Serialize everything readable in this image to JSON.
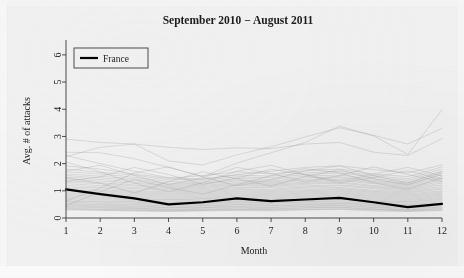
{
  "figure": {
    "title": "September 2010 − August 2011",
    "background_color": "#ededed",
    "panel_color": "#f1f1f1"
  },
  "legend": {
    "entries": [
      {
        "label": "France",
        "color": "#000000",
        "linewidth": 2.2
      }
    ]
  },
  "chart_data": {
    "type": "line",
    "title": "September 2010 − August 2011",
    "xlabel": "Month",
    "ylabel": "Avg. # of attacks",
    "xlim": [
      1,
      12
    ],
    "ylim": [
      0,
      6.4
    ],
    "xticks": [
      1,
      2,
      3,
      4,
      5,
      6,
      7,
      8,
      9,
      10,
      11,
      12
    ],
    "xticklabels": [
      "1",
      "2",
      "3",
      "4",
      "5",
      "6",
      "7",
      "8",
      "9",
      "10",
      "11",
      "12"
    ],
    "yticks": [
      0,
      1,
      2,
      3,
      4,
      5,
      6
    ],
    "yticklabels": [
      "0",
      "1",
      "2",
      "3",
      "4",
      "5",
      "6"
    ],
    "grid": false,
    "legend_position": "upper left",
    "x": [
      1,
      2,
      3,
      4,
      5,
      6,
      7,
      8,
      9,
      10,
      11,
      12
    ],
    "highlight_color": "#000000",
    "background_series_color": "#9a9a9a",
    "series": [
      {
        "name": "France",
        "highlight": true,
        "values": [
          1.05,
          0.88,
          0.72,
          0.5,
          0.58,
          0.72,
          0.62,
          0.68,
          0.74,
          0.58,
          0.4,
          0.52
        ]
      },
      {
        "name": "country-01",
        "highlight": false,
        "values": [
          2.9,
          2.78,
          2.72,
          2.6,
          2.52,
          2.58,
          2.55,
          2.72,
          2.78,
          2.42,
          2.3,
          2.92
        ]
      },
      {
        "name": "country-02",
        "highlight": false,
        "values": [
          2.26,
          2.6,
          2.72,
          2.1,
          1.95,
          2.32,
          2.62,
          2.98,
          3.32,
          3.04,
          2.72,
          3.3
        ]
      },
      {
        "name": "country-03",
        "highlight": false,
        "values": [
          2.42,
          2.4,
          2.18,
          1.86,
          1.52,
          2.02,
          2.4,
          2.78,
          3.38,
          3.02,
          2.34,
          3.98
        ]
      },
      {
        "name": "country-04",
        "highlight": false,
        "values": [
          2.3,
          2.0,
          1.72,
          1.48,
          1.42,
          1.6,
          1.72,
          1.86,
          1.92,
          1.78,
          1.66,
          1.95
        ]
      },
      {
        "name": "country-05",
        "highlight": false,
        "values": [
          1.92,
          1.8,
          1.62,
          1.46,
          1.56,
          1.7,
          1.62,
          1.74,
          1.8,
          1.62,
          1.52,
          1.88
        ]
      },
      {
        "name": "country-06",
        "highlight": false,
        "values": [
          1.8,
          1.68,
          1.58,
          1.4,
          1.44,
          1.58,
          1.54,
          1.66,
          1.72,
          1.56,
          1.44,
          1.8
        ]
      },
      {
        "name": "country-07",
        "highlight": false,
        "values": [
          1.7,
          1.62,
          1.5,
          1.34,
          1.38,
          1.52,
          1.48,
          1.6,
          1.66,
          1.5,
          1.38,
          1.72
        ]
      },
      {
        "name": "country-08",
        "highlight": false,
        "values": [
          1.62,
          1.54,
          1.44,
          1.28,
          1.32,
          1.46,
          1.42,
          1.54,
          1.58,
          1.44,
          1.32,
          1.66
        ]
      },
      {
        "name": "country-09",
        "highlight": false,
        "values": [
          1.56,
          1.48,
          1.38,
          1.24,
          1.28,
          1.4,
          1.36,
          1.48,
          1.52,
          1.38,
          1.28,
          1.58
        ]
      },
      {
        "name": "country-10",
        "highlight": false,
        "values": [
          1.5,
          1.42,
          1.32,
          1.2,
          1.24,
          1.36,
          1.32,
          1.42,
          1.48,
          1.34,
          1.24,
          1.52
        ]
      },
      {
        "name": "country-11",
        "highlight": false,
        "values": [
          1.44,
          1.36,
          1.28,
          1.16,
          1.2,
          1.3,
          1.28,
          1.38,
          1.42,
          1.3,
          1.2,
          1.46
        ]
      },
      {
        "name": "country-12",
        "highlight": false,
        "values": [
          1.38,
          1.3,
          1.22,
          1.12,
          1.16,
          1.26,
          1.24,
          1.32,
          1.38,
          1.26,
          1.16,
          1.4
        ]
      },
      {
        "name": "country-13",
        "highlight": false,
        "values": [
          1.32,
          1.26,
          1.18,
          1.08,
          1.12,
          1.22,
          1.2,
          1.28,
          1.32,
          1.2,
          1.12,
          1.34
        ]
      },
      {
        "name": "country-14",
        "highlight": false,
        "values": [
          1.26,
          1.2,
          1.12,
          1.04,
          1.08,
          1.18,
          1.16,
          1.24,
          1.28,
          1.16,
          1.08,
          1.28
        ]
      },
      {
        "name": "country-15",
        "highlight": false,
        "values": [
          1.2,
          1.14,
          1.08,
          1.0,
          1.04,
          1.12,
          1.12,
          1.18,
          1.22,
          1.12,
          1.04,
          1.22
        ]
      },
      {
        "name": "country-16",
        "highlight": false,
        "values": [
          1.14,
          1.1,
          1.02,
          0.96,
          1.0,
          1.08,
          1.06,
          1.14,
          1.18,
          1.08,
          1.0,
          1.16
        ]
      },
      {
        "name": "country-17",
        "highlight": false,
        "values": [
          1.1,
          1.04,
          0.98,
          0.92,
          0.96,
          1.04,
          1.02,
          1.1,
          1.12,
          1.02,
          0.96,
          1.1
        ]
      },
      {
        "name": "country-18",
        "highlight": false,
        "values": [
          1.04,
          1.0,
          0.94,
          0.88,
          0.92,
          1.0,
          0.98,
          1.04,
          1.08,
          0.98,
          0.92,
          1.06
        ]
      },
      {
        "name": "country-19",
        "highlight": false,
        "values": [
          1.0,
          0.96,
          0.9,
          0.84,
          0.88,
          0.96,
          0.94,
          1.0,
          1.04,
          0.94,
          0.88,
          1.0
        ]
      },
      {
        "name": "country-20",
        "highlight": false,
        "values": [
          0.96,
          0.92,
          0.86,
          0.8,
          0.84,
          0.92,
          0.9,
          0.96,
          1.0,
          0.9,
          0.84,
          0.96
        ]
      },
      {
        "name": "country-21",
        "highlight": false,
        "values": [
          0.92,
          0.88,
          0.82,
          0.76,
          0.8,
          0.88,
          0.86,
          0.92,
          0.96,
          0.86,
          0.8,
          0.92
        ]
      },
      {
        "name": "country-22",
        "highlight": false,
        "values": [
          0.88,
          0.84,
          0.78,
          0.72,
          0.76,
          0.84,
          0.82,
          0.88,
          0.92,
          0.82,
          0.76,
          0.88
        ]
      },
      {
        "name": "country-23",
        "highlight": false,
        "values": [
          0.84,
          0.8,
          0.74,
          0.68,
          0.72,
          0.8,
          0.78,
          0.84,
          0.88,
          0.78,
          0.72,
          0.84
        ]
      },
      {
        "name": "country-24",
        "highlight": false,
        "values": [
          0.8,
          0.76,
          0.7,
          0.66,
          0.7,
          0.76,
          0.74,
          0.8,
          0.84,
          0.74,
          0.68,
          0.8
        ]
      },
      {
        "name": "country-25",
        "highlight": false,
        "values": [
          0.76,
          0.72,
          0.68,
          0.62,
          0.66,
          0.72,
          0.7,
          0.76,
          0.8,
          0.7,
          0.64,
          0.76
        ]
      },
      {
        "name": "country-26",
        "highlight": false,
        "values": [
          0.72,
          0.68,
          0.64,
          0.58,
          0.62,
          0.68,
          0.66,
          0.72,
          0.76,
          0.66,
          0.6,
          0.72
        ]
      },
      {
        "name": "country-27",
        "highlight": false,
        "values": [
          0.68,
          0.64,
          0.6,
          0.56,
          0.58,
          0.64,
          0.64,
          0.68,
          0.72,
          0.62,
          0.58,
          0.68
        ]
      },
      {
        "name": "country-28",
        "highlight": false,
        "values": [
          0.64,
          0.6,
          0.58,
          0.52,
          0.56,
          0.6,
          0.6,
          0.64,
          0.68,
          0.6,
          0.54,
          0.64
        ]
      },
      {
        "name": "country-29",
        "highlight": false,
        "values": [
          0.6,
          0.58,
          0.54,
          0.5,
          0.52,
          0.58,
          0.56,
          0.6,
          0.64,
          0.56,
          0.5,
          0.6
        ]
      },
      {
        "name": "country-30",
        "highlight": false,
        "values": [
          0.58,
          0.54,
          0.5,
          0.46,
          0.5,
          0.54,
          0.54,
          0.58,
          0.6,
          0.52,
          0.48,
          0.56
        ]
      },
      {
        "name": "country-31",
        "highlight": false,
        "values": [
          0.54,
          0.5,
          0.48,
          0.44,
          0.46,
          0.5,
          0.5,
          0.54,
          0.56,
          0.5,
          0.44,
          0.52
        ]
      },
      {
        "name": "country-32",
        "highlight": false,
        "values": [
          0.5,
          0.48,
          0.44,
          0.4,
          0.44,
          0.48,
          0.46,
          0.5,
          0.54,
          0.46,
          0.42,
          0.5
        ]
      },
      {
        "name": "country-33",
        "highlight": false,
        "values": [
          0.48,
          0.44,
          0.42,
          0.38,
          0.4,
          0.44,
          0.44,
          0.48,
          0.5,
          0.44,
          0.38,
          0.46
        ]
      },
      {
        "name": "country-34",
        "highlight": false,
        "values": [
          0.44,
          0.42,
          0.38,
          0.36,
          0.38,
          0.42,
          0.4,
          0.44,
          0.46,
          0.4,
          0.36,
          0.42
        ]
      },
      {
        "name": "country-35",
        "highlight": false,
        "values": [
          0.42,
          0.38,
          0.36,
          0.32,
          0.36,
          0.38,
          0.38,
          0.42,
          0.44,
          0.38,
          0.32,
          0.4
        ]
      },
      {
        "name": "country-36",
        "highlight": false,
        "values": [
          0.38,
          0.36,
          0.34,
          0.3,
          0.32,
          0.36,
          0.34,
          0.38,
          0.4,
          0.34,
          0.3,
          0.36
        ]
      },
      {
        "name": "country-37",
        "highlight": false,
        "values": [
          0.36,
          0.32,
          0.3,
          0.28,
          0.3,
          0.32,
          0.32,
          0.36,
          0.38,
          0.32,
          0.28,
          0.34
        ]
      },
      {
        "name": "country-38",
        "highlight": false,
        "values": [
          0.32,
          0.3,
          0.28,
          0.26,
          0.28,
          0.3,
          0.3,
          0.32,
          0.34,
          0.3,
          0.26,
          0.3
        ]
      },
      {
        "name": "country-39",
        "highlight": false,
        "values": [
          0.3,
          0.28,
          0.26,
          0.24,
          0.26,
          0.28,
          0.26,
          0.3,
          0.32,
          0.26,
          0.24,
          0.28
        ]
      },
      {
        "name": "country-40",
        "highlight": false,
        "values": [
          0.46,
          0.96,
          1.42,
          1.12,
          0.88,
          1.22,
          1.56,
          1.82,
          1.66,
          1.3,
          1.06,
          1.48
        ]
      },
      {
        "name": "country-41",
        "highlight": false,
        "values": [
          1.48,
          1.28,
          0.92,
          1.34,
          1.7,
          1.44,
          1.18,
          1.52,
          1.78,
          1.44,
          1.22,
          1.62
        ]
      },
      {
        "name": "country-42",
        "highlight": false,
        "values": [
          2.06,
          1.7,
          1.28,
          0.96,
          1.3,
          1.72,
          1.94,
          1.6,
          1.34,
          1.62,
          1.86,
          1.54
        ]
      },
      {
        "name": "country-43",
        "highlight": false,
        "values": [
          0.62,
          1.1,
          1.66,
          1.88,
          1.52,
          1.18,
          1.4,
          1.74,
          1.92,
          1.56,
          1.28,
          1.7
        ]
      },
      {
        "name": "country-44",
        "highlight": false,
        "values": [
          1.72,
          1.94,
          1.56,
          1.22,
          1.48,
          1.86,
          1.64,
          1.32,
          1.56,
          1.88,
          1.6,
          1.34
        ]
      },
      {
        "name": "country-45",
        "highlight": false,
        "values": [
          1.34,
          1.52,
          1.86,
          1.6,
          1.24,
          1.46,
          1.8,
          1.58,
          1.28,
          1.5,
          1.74,
          1.42
        ]
      }
    ]
  }
}
